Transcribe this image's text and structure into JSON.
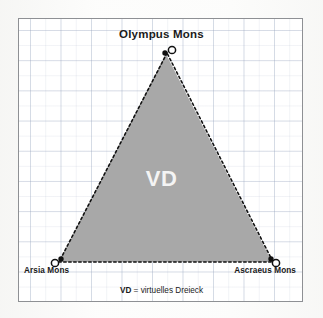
{
  "figure": {
    "type": "diagram",
    "apex_label": "Olympus Mons",
    "left_label": "Arsia Mons",
    "right_label": "Ascraeus Mons",
    "inner_label": "VD",
    "caption_abbrev": "VD",
    "caption_rest": " = virtuelles Dreieck",
    "colors": {
      "triangle_fill": "#a8a8a8",
      "edge": "#111111",
      "frame_border": "#8e9094",
      "grid": "#96a5be",
      "background": "#ffffff",
      "label_text": "#1a1a1a",
      "inner_label_text": "#f4f4f4"
    },
    "vertices": [
      {
        "name": "Olympus Mons",
        "x": 148,
        "y": 34,
        "marker": "open-circle-with-dot"
      },
      {
        "name": "Arsia Mons",
        "x": 40,
        "y": 243,
        "marker": "open-circle-with-dot"
      },
      {
        "name": "Ascraeus Mons",
        "x": 254,
        "y": 243,
        "marker": "open-circle-with-dot"
      }
    ],
    "edge_style": "dotted",
    "grid_visible": true
  }
}
